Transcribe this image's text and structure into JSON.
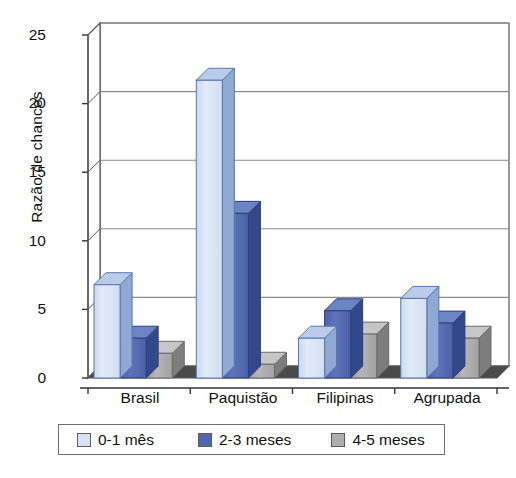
{
  "chart_data": {
    "type": "bar",
    "title": "",
    "xlabel": "",
    "ylabel": "Razão de chances",
    "categories": [
      "Brasil",
      "Paquistão",
      "Filipinas",
      "Agrupada"
    ],
    "series": [
      {
        "name": "0-1 mês",
        "color": "#d7e3f4",
        "values": [
          6.8,
          21.7,
          2.9,
          5.8
        ]
      },
      {
        "name": "2-3 meses",
        "color": "#4f67ae",
        "values": [
          2.9,
          12.0,
          4.9,
          4.0
        ]
      },
      {
        "name": "4-5 meses",
        "color": "#aeaeae",
        "values": [
          1.8,
          1.0,
          3.2,
          2.9
        ]
      }
    ],
    "ylim": [
      0,
      25
    ],
    "yticks": [
      0,
      5,
      10,
      15,
      20,
      25
    ],
    "ytick_labels": [
      "0",
      "5",
      "10",
      "15",
      "20",
      "25"
    ],
    "grid": "horizontal",
    "legend_position": "bottom",
    "style": "3d-column",
    "plot_background": "#ffffff",
    "axis_color": "#555555",
    "grid_color": "#8a8a8a"
  },
  "axis": {
    "y_label": "Razão de chances"
  }
}
